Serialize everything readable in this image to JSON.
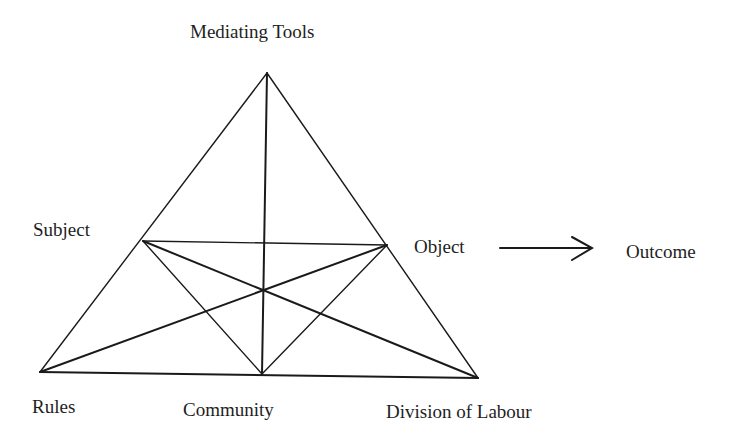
{
  "diagram": {
    "nodes": {
      "mediating_tools": "Mediating Tools",
      "subject": "Subject",
      "object": "Object",
      "outcome": "Outcome",
      "rules": "Rules",
      "community": "Community",
      "division_of_labour": "Division of Labour"
    },
    "edges": [
      {
        "from": "mediating_tools",
        "to": "rules"
      },
      {
        "from": "mediating_tools",
        "to": "division_of_labour"
      },
      {
        "from": "rules",
        "to": "division_of_labour"
      },
      {
        "from": "subject",
        "to": "object"
      },
      {
        "from": "mediating_tools",
        "to": "community"
      },
      {
        "from": "subject",
        "to": "division_of_labour"
      },
      {
        "from": "rules",
        "to": "object"
      },
      {
        "from": "subject",
        "to": "community"
      },
      {
        "from": "object",
        "to": "community"
      },
      {
        "from": "object",
        "to": "outcome",
        "arrow": true
      }
    ]
  }
}
